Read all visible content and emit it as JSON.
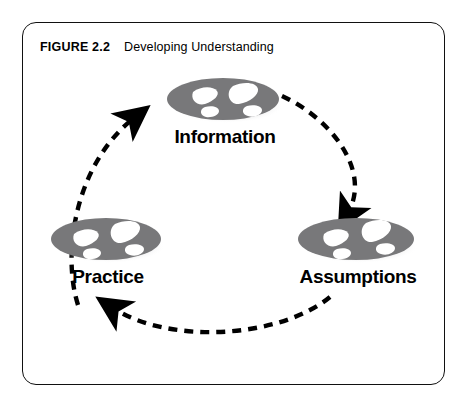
{
  "figure": {
    "label": "FIGURE 2.2",
    "title": "Developing Understanding"
  },
  "diagram": {
    "type": "cycle",
    "direction": "clockwise",
    "node_icon": "footprints-icon",
    "connector_style": "dashed-curved-arrow",
    "colors": {
      "ellipse_fill": "#78787a",
      "ellipse_shadow": "#c9c9cb",
      "footprint_fill": "#ffffff",
      "arrow": "#000000",
      "border": "#111111",
      "background": "#ffffff",
      "text": "#000000"
    },
    "nodes": [
      {
        "id": "information",
        "label": "Information"
      },
      {
        "id": "assumptions",
        "label": "Assumptions"
      },
      {
        "id": "practice",
        "label": "Practice"
      }
    ],
    "arrows": [
      {
        "id": "information-to-assumptions",
        "from": "Information",
        "to": "Assumptions"
      },
      {
        "id": "assumptions-to-practice",
        "from": "Assumptions",
        "to": "Practice"
      },
      {
        "id": "practice-to-information",
        "from": "Practice",
        "to": "Information"
      }
    ]
  }
}
